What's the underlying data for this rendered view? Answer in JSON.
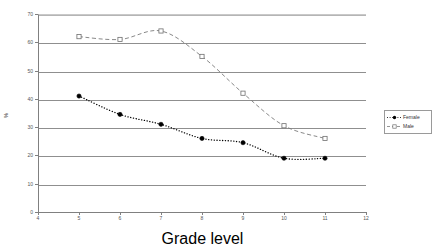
{
  "chart_data": {
    "type": "line",
    "title": "",
    "xlabel": "Grade level",
    "ylabel": "%",
    "xlim": [
      4,
      12
    ],
    "ylim": [
      0,
      70
    ],
    "xticks": [
      "4",
      "5",
      "6",
      "7",
      "8",
      "9",
      "10",
      "11",
      "12"
    ],
    "yticks": [
      "0",
      "10",
      "20",
      "30",
      "40",
      "50",
      "60",
      "70"
    ],
    "grid": "horizontal",
    "legend_position": "right",
    "x": [
      5,
      6,
      7,
      8,
      9,
      10,
      11
    ],
    "series": [
      {
        "name": "Female",
        "marker": "filled-circle",
        "line_style": "dotted",
        "color": "#000000",
        "values": [
          41,
          34.5,
          31,
          26,
          24.5,
          19,
          19
        ]
      },
      {
        "name": "Male",
        "marker": "open-square",
        "line_style": "dashed",
        "color": "#7b7b7b",
        "values": [
          62,
          61,
          64,
          55,
          42,
          30.5,
          26
        ]
      }
    ]
  },
  "legend": {
    "entries": [
      {
        "label": "Female"
      },
      {
        "label": "Male"
      }
    ]
  },
  "axes": {
    "x_title": "Grade level",
    "y_title": "%"
  }
}
